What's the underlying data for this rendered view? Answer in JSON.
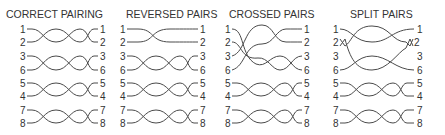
{
  "diagram": {
    "panels": [
      {
        "title": "CORRECT PAIRING",
        "left_labels": [
          "1",
          "2",
          "3",
          "6",
          "5",
          "4",
          "7",
          "8"
        ],
        "right_labels": [
          "1",
          "2",
          "3",
          "6",
          "5",
          "4",
          "7",
          "8"
        ]
      },
      {
        "title": "REVERSED PAIRS",
        "left_labels": [
          "1",
          "2",
          "3",
          "6",
          "5",
          "4",
          "7",
          "8"
        ],
        "right_labels": [
          "1",
          "2",
          "3",
          "6",
          "5",
          "4",
          "7",
          "8"
        ]
      },
      {
        "title": "CROSSED PAIRS",
        "left_labels": [
          "1",
          "2",
          "3",
          "6",
          "5",
          "4",
          "7",
          "8"
        ],
        "right_labels": [
          "1",
          "2",
          "3",
          "6",
          "5",
          "4",
          "7",
          "8"
        ]
      },
      {
        "title": "SPLIT PAIRS",
        "left_labels": [
          "1",
          "2",
          "3",
          "6",
          "5",
          "4",
          "7",
          "8"
        ],
        "right_labels": [
          "1",
          "2",
          "3",
          "6",
          "5",
          "4",
          "7",
          "8"
        ]
      }
    ]
  },
  "colors": {
    "line": "#4a4a4a",
    "text": "#333333",
    "background": "#ffffff"
  }
}
